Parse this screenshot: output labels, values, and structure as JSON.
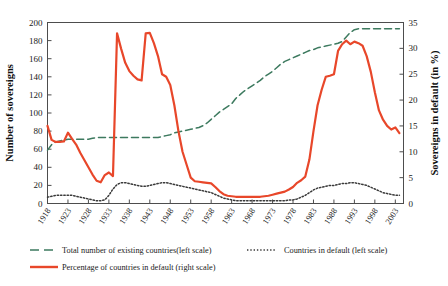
{
  "chart_data": {
    "type": "line",
    "title": "",
    "xlabel": "",
    "ylabel": "Number of sovereigns",
    "y2label": "Sovereigns in default (in %)",
    "grid": false,
    "legend_position": "bottom",
    "xlim": [
      1918,
      2005
    ],
    "ylim": [
      0,
      200
    ],
    "y2lim": [
      0,
      35
    ],
    "ytick_labels": [
      "0",
      "20",
      "40",
      "60",
      "80",
      "100",
      "120",
      "140",
      "160",
      "180",
      "200"
    ],
    "ytick_values": [
      0,
      20,
      40,
      60,
      80,
      100,
      120,
      140,
      160,
      180,
      200
    ],
    "y2tick_labels": [
      "0",
      "5",
      "10",
      "15",
      "20",
      "25",
      "30",
      "35"
    ],
    "y2tick_values": [
      0,
      5,
      10,
      15,
      20,
      25,
      30,
      35
    ],
    "xtick_labels": [
      "1918",
      "1923",
      "1928",
      "1933",
      "1938",
      "1943",
      "1948",
      "1953",
      "1958",
      "1963",
      "1968",
      "1973",
      "1978",
      "1983",
      "1988",
      "1993",
      "1998",
      "2003"
    ],
    "xtick_values": [
      1918,
      1923,
      1928,
      1933,
      1938,
      1943,
      1948,
      1953,
      1958,
      1963,
      1968,
      1973,
      1978,
      1983,
      1988,
      1993,
      1998,
      2003
    ],
    "x": [
      1918,
      1919,
      1920,
      1921,
      1922,
      1923,
      1924,
      1925,
      1926,
      1927,
      1928,
      1929,
      1930,
      1931,
      1932,
      1933,
      1934,
      1935,
      1936,
      1937,
      1938,
      1939,
      1940,
      1941,
      1942,
      1943,
      1944,
      1945,
      1946,
      1947,
      1948,
      1949,
      1950,
      1951,
      1952,
      1953,
      1954,
      1955,
      1956,
      1957,
      1958,
      1959,
      1960,
      1961,
      1962,
      1963,
      1964,
      1965,
      1966,
      1967,
      1968,
      1969,
      1970,
      1971,
      1972,
      1973,
      1974,
      1975,
      1976,
      1977,
      1978,
      1979,
      1980,
      1981,
      1982,
      1983,
      1984,
      1985,
      1986,
      1987,
      1988,
      1989,
      1990,
      1991,
      1992,
      1993,
      1994,
      1995,
      1996,
      1997,
      1998,
      1999,
      2000,
      2001,
      2002,
      2003,
      2004
    ],
    "series": [
      {
        "name": "Total number of existing countries(left scale)",
        "axis": "left",
        "style": "dashed",
        "color": "#3d7a5f",
        "values": [
          59,
          65,
          68,
          69,
          70,
          71,
          71,
          71,
          71,
          71,
          71,
          72,
          73,
          73,
          73,
          73,
          73,
          73,
          73,
          73,
          73,
          73,
          73,
          73,
          73,
          73,
          73,
          73,
          74,
          75,
          76,
          78,
          79,
          80,
          81,
          82,
          83,
          84,
          86,
          89,
          93,
          97,
          101,
          104,
          107,
          110,
          116,
          120,
          124,
          127,
          130,
          133,
          136,
          140,
          143,
          146,
          150,
          154,
          157,
          159,
          161,
          163,
          165,
          167,
          169,
          170,
          172,
          173,
          174,
          175,
          176,
          177,
          179,
          184,
          189,
          192,
          193,
          193,
          193,
          193,
          193,
          193,
          193,
          193,
          193,
          193,
          193
        ]
      },
      {
        "name": "Countries in default (left scale)",
        "axis": "left",
        "style": "dotted",
        "color": "#3a3a3a",
        "values": [
          7,
          8,
          9,
          9,
          9,
          9,
          9,
          8,
          7,
          6,
          5,
          4,
          3,
          3,
          4,
          9,
          16,
          21,
          23,
          23,
          22,
          21,
          20,
          19,
          19,
          20,
          21,
          22,
          23,
          23,
          22,
          21,
          20,
          19,
          18,
          17,
          16,
          15,
          14,
          13,
          12,
          10,
          8,
          6,
          5,
          4,
          3,
          3,
          3,
          3,
          3,
          3,
          3,
          3,
          3,
          3,
          3,
          3,
          3,
          4,
          4,
          5,
          7,
          9,
          12,
          15,
          17,
          18,
          19,
          20,
          20,
          21,
          22,
          22,
          23,
          23,
          22,
          21,
          20,
          18,
          16,
          14,
          12,
          11,
          10,
          9,
          9
        ]
      },
      {
        "name": "Percentage of countries in default (right scale)",
        "axis": "right",
        "style": "solid",
        "color": "#e8472a",
        "values": [
          15.0,
          12.3,
          11.9,
          11.9,
          12.0,
          13.7,
          12.5,
          11.4,
          9.8,
          8.4,
          7.0,
          5.6,
          4.4,
          4.1,
          5.5,
          6.0,
          5.3,
          32.9,
          29.9,
          27.2,
          25.6,
          24.7,
          24.0,
          23.8,
          32.9,
          33.0,
          31.0,
          28.5,
          25.0,
          24.5,
          22.9,
          19.0,
          14.0,
          10.0,
          7.5,
          5.0,
          4.3,
          4.2,
          4.1,
          4.0,
          3.9,
          3.2,
          2.4,
          1.8,
          1.5,
          1.4,
          1.3,
          1.3,
          1.3,
          1.3,
          1.3,
          1.3,
          1.3,
          1.4,
          1.5,
          1.7,
          1.9,
          2.1,
          2.3,
          2.7,
          3.2,
          4.0,
          4.5,
          5.2,
          8.5,
          14.0,
          19.0,
          22.0,
          24.5,
          24.7,
          25.0,
          29.5,
          30.8,
          31.5,
          30.8,
          31.3,
          31.0,
          30.5,
          28.5,
          25.5,
          21.5,
          18.0,
          16.2,
          15.0,
          14.3,
          14.7,
          13.6
        ]
      }
    ],
    "legend": [
      {
        "label": "Total number of existing countries(left scale)",
        "style": "dashed",
        "color": "#3d7a5f"
      },
      {
        "label": "Countries in default (left scale)",
        "style": "dotted",
        "color": "#3a3a3a"
      },
      {
        "label": "Percentage of countries in default (right scale)",
        "style": "solid",
        "color": "#e8472a"
      }
    ]
  }
}
